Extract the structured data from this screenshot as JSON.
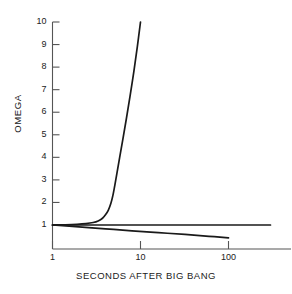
{
  "chart_data": {
    "type": "line",
    "title": "",
    "xlabel": "SECONDS AFTER BIG BANG",
    "ylabel": "OMEGA",
    "xscale": "log",
    "yscale": "linear",
    "xlim": [
      1,
      300
    ],
    "ylim": [
      0.35,
      10
    ],
    "grid": false,
    "legend": "none",
    "line_color": "#1a1a1a",
    "axis_color": "#555555",
    "background": "#ffffff",
    "xticks": [
      {
        "value": 1,
        "label": "1"
      },
      {
        "value": 10,
        "label": "10"
      },
      {
        "value": 100,
        "label": "100"
      }
    ],
    "yticks": [
      {
        "value": 1,
        "label": "1"
      },
      {
        "value": 2,
        "label": "2"
      },
      {
        "value": 3,
        "label": "3"
      },
      {
        "value": 4,
        "label": "4"
      },
      {
        "value": 5,
        "label": "5"
      },
      {
        "value": 6,
        "label": "6"
      },
      {
        "value": 7,
        "label": "7"
      },
      {
        "value": 8,
        "label": "8"
      },
      {
        "value": 9,
        "label": "9"
      },
      {
        "value": 10,
        "label": "10"
      }
    ],
    "series": [
      {
        "name": "closed-universe",
        "description": "Omega rises steeply away from 1",
        "points": [
          [
            1.0,
            1.0
          ],
          [
            1.4,
            1.01
          ],
          [
            1.9,
            1.03
          ],
          [
            2.4,
            1.06
          ],
          [
            2.9,
            1.11
          ],
          [
            3.3,
            1.18
          ],
          [
            3.7,
            1.3
          ],
          [
            4.0,
            1.45
          ],
          [
            4.3,
            1.65
          ],
          [
            4.6,
            1.95
          ],
          [
            4.85,
            2.3
          ],
          [
            5.1,
            2.75
          ],
          [
            5.4,
            3.3
          ],
          [
            5.8,
            4.0
          ],
          [
            6.3,
            4.8
          ],
          [
            6.9,
            5.7
          ],
          [
            7.6,
            6.7
          ],
          [
            8.4,
            7.8
          ],
          [
            9.2,
            8.9
          ],
          [
            10.0,
            10.0
          ]
        ]
      },
      {
        "name": "flat-universe",
        "description": "Omega stays at 1",
        "points": [
          [
            1.0,
            1.0
          ],
          [
            10.0,
            1.0
          ],
          [
            100.0,
            1.0
          ],
          [
            300.0,
            1.0
          ]
        ]
      },
      {
        "name": "open-universe",
        "description": "Omega falls away from 1 toward zero",
        "points": [
          [
            1.0,
            1.0
          ],
          [
            2.0,
            0.92
          ],
          [
            4.0,
            0.83
          ],
          [
            8.0,
            0.74
          ],
          [
            16.0,
            0.66
          ],
          [
            32.0,
            0.58
          ],
          [
            60.0,
            0.5
          ],
          [
            100.0,
            0.43
          ]
        ]
      }
    ]
  }
}
